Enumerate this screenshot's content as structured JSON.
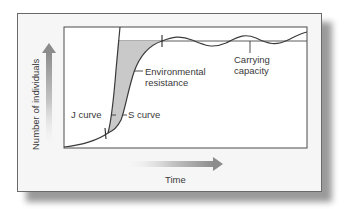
{
  "figure": {
    "type": "population growth diagram",
    "y_axis_label": "Number of individuals",
    "x_axis_label": "Time",
    "labels": {
      "j_curve": "J curve",
      "s_curve": "S curve",
      "environmental_resistance_line1": "Environmental",
      "environmental_resistance_line2": "resistance",
      "carrying_capacity_line1": "Carrying",
      "carrying_capacity_line2": "capacity"
    },
    "colors": {
      "curve": "#3a3a3a",
      "shaded_region": "#c9c9c9",
      "plot_background": "#ffffff",
      "panel_background": "#f6f6f6",
      "arrow_gradient_start": "#f0f0f0",
      "arrow_gradient_end": "#8a8a8a"
    }
  }
}
